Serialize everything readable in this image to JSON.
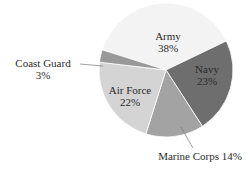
{
  "chart_data": {
    "type": "pie",
    "title": "",
    "categories": [
      "Army",
      "Navy",
      "Marine Corps",
      "Air Force",
      "Coast Guard"
    ],
    "values": [
      38,
      23,
      14,
      22,
      3
    ],
    "unit": "%",
    "colors": [
      "#f3f3f3",
      "#6e6e6e",
      "#a3a3a3",
      "#d4d4d4",
      "#999999"
    ],
    "start_angle_deg": -29,
    "direction": "clockwise",
    "labels": [
      {
        "name": "Army",
        "value": "38%"
      },
      {
        "name": "Navy",
        "value": "23%"
      },
      {
        "name": "Marine Corps",
        "value": "14%",
        "text": "Marine Corps 14%"
      },
      {
        "name": "Air Force",
        "value": "22%"
      },
      {
        "name": "Coast Guard",
        "value": "3%"
      }
    ],
    "legend": "none"
  }
}
